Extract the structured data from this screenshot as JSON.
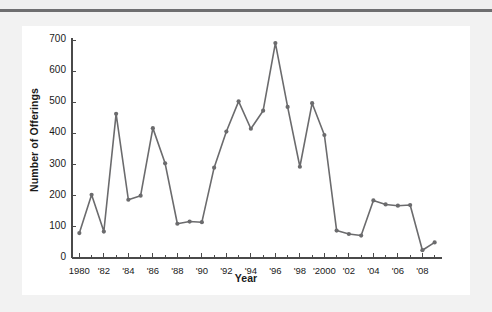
{
  "figure": {
    "panel_background": "#ffffff",
    "page_background": "#f2f2f2",
    "rule_color": "#6e6e70"
  },
  "chart_data": {
    "type": "line",
    "title": "",
    "subtitle": "",
    "xlabel": "Year",
    "ylabel": "Number of Offerings",
    "x": [
      1980,
      1981,
      1982,
      1983,
      1984,
      1985,
      1986,
      1987,
      1988,
      1989,
      1990,
      1991,
      1992,
      1993,
      1994,
      1995,
      1996,
      1997,
      1998,
      1999,
      2000,
      2001,
      2002,
      2003,
      2004,
      2005,
      2006,
      2007,
      2008,
      2009
    ],
    "values": [
      80,
      203,
      85,
      463,
      187,
      200,
      417,
      304,
      110,
      117,
      115,
      290,
      406,
      503,
      415,
      473,
      690,
      485,
      293,
      497,
      395,
      88,
      77,
      72,
      185,
      172,
      168,
      170,
      25,
      50
    ],
    "series": [
      {
        "name": "Number of Offerings",
        "color": "#6b6b6d",
        "marker": "circle",
        "values": [
          80,
          203,
          85,
          463,
          187,
          200,
          417,
          304,
          110,
          117,
          115,
          290,
          406,
          503,
          415,
          473,
          690,
          485,
          293,
          497,
          395,
          88,
          77,
          72,
          185,
          172,
          168,
          170,
          25,
          50
        ]
      }
    ],
    "xlim": [
      1979.4,
      2009.6
    ],
    "ylim": [
      0,
      700
    ],
    "ytick_values": [
      0,
      100,
      200,
      300,
      400,
      500,
      600,
      700
    ],
    "ytick_labels": [
      "0",
      "100",
      "200",
      "300",
      "400",
      "500",
      "600",
      "700"
    ],
    "xtick_values": [
      1980,
      1982,
      1984,
      1986,
      1988,
      1990,
      1992,
      1994,
      1996,
      1998,
      2000,
      2002,
      2004,
      2006,
      2008
    ],
    "xtick_labels": [
      "1980",
      "'82",
      "'84",
      "'86",
      "'88",
      "'90",
      "'92",
      "'94",
      "'96",
      "'98",
      "'2000",
      "'02",
      "'04",
      "'06",
      "'08"
    ],
    "xtick_minor_values": [
      1981,
      1983,
      1985,
      1987,
      1989,
      1991,
      1993,
      1995,
      1997,
      1999,
      2001,
      2003,
      2005,
      2007,
      2009
    ],
    "grid": false,
    "legend": null,
    "annotations": []
  }
}
